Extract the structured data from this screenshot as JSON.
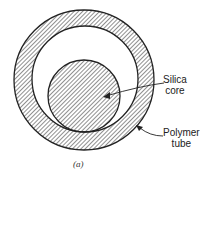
{
  "diagram": {
    "type": "cross-section",
    "labels": {
      "core_line1": "Silica",
      "core_line2": "core",
      "tube_line1": "Polymer",
      "tube_line2": "tube"
    },
    "caption": "(a)",
    "colors": {
      "stroke": "#222222",
      "background": "#ffffff"
    }
  }
}
